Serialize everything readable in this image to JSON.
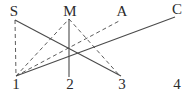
{
  "figure": {
    "width": 189,
    "height": 98,
    "background_color": "#ffffff",
    "stroke_color": "#4a4a4a",
    "label_color": "#2b2b2b"
  },
  "labels": {
    "top": [
      {
        "text": "S",
        "x": 14,
        "y": 11
      },
      {
        "text": "M",
        "x": 70,
        "y": 11
      },
      {
        "text": "A",
        "x": 122,
        "y": 11
      },
      {
        "text": "C",
        "x": 177,
        "y": 9
      }
    ],
    "bottom": [
      {
        "text": "1",
        "x": 16,
        "y": 84
      },
      {
        "text": "2",
        "x": 70,
        "y": 84
      },
      {
        "text": "3",
        "x": 122,
        "y": 84
      },
      {
        "text": "4",
        "x": 177,
        "y": 84
      }
    ]
  },
  "edges": [
    {
      "name": "edge-S-to-3",
      "from": "S",
      "to": "3",
      "style": "solid",
      "x1": 15,
      "y1": 20,
      "x2": 121,
      "y2": 76
    },
    {
      "name": "edge-1-to-C",
      "from": "1",
      "to": "C",
      "style": "solid",
      "x1": 16,
      "y1": 76,
      "x2": 175,
      "y2": 17
    },
    {
      "name": "edge-M-to-2",
      "from": "M",
      "to": "2",
      "style": "solid",
      "x1": 69,
      "y1": 19,
      "x2": 69,
      "y2": 77
    },
    {
      "name": "edge-S-to-1",
      "from": "S",
      "to": "1",
      "style": "dashed",
      "x1": 15,
      "y1": 20,
      "x2": 16,
      "y2": 76
    },
    {
      "name": "edge-1-to-M",
      "from": "1",
      "to": "M",
      "style": "dashed",
      "x1": 16,
      "y1": 76,
      "x2": 69,
      "y2": 19
    },
    {
      "name": "edge-1-to-A",
      "from": "1",
      "to": "A",
      "style": "dashed",
      "x1": 16,
      "y1": 76,
      "x2": 121,
      "y2": 20
    },
    {
      "name": "edge-M-to-3",
      "from": "M",
      "to": "3",
      "style": "dashed",
      "x1": 69,
      "y1": 19,
      "x2": 120,
      "y2": 76
    }
  ]
}
